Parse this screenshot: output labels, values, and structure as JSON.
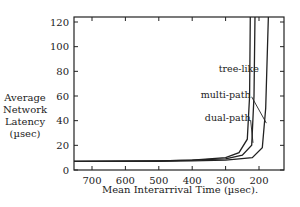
{
  "chart_data": {
    "type": "line",
    "title": "",
    "xlabel": "Mean Interarrival Time (µsec).",
    "ylabel": "Average Network Latency (µsec)",
    "ylabel_lines": [
      "Average",
      "Network",
      "Latency",
      "(µsec)"
    ],
    "x_reversed": true,
    "xlim": [
      754,
      127
    ],
    "ylim": [
      0,
      120
    ],
    "x_ticks": [
      700,
      600,
      500,
      400,
      300,
      200
    ],
    "y_ticks": [
      0,
      20,
      40,
      60,
      80,
      100,
      120
    ],
    "grid": false,
    "legend": "inline annotations",
    "series": [
      {
        "name": "tree-like",
        "x": [
          754,
          500,
          400,
          300,
          260,
          235,
          228,
          226
        ],
        "y": [
          7,
          7.5,
          8,
          10,
          14,
          25,
          60,
          125
        ]
      },
      {
        "name": "multi-path",
        "x": [
          754,
          500,
          400,
          300,
          250,
          222,
          215,
          212
        ],
        "y": [
          7,
          7.5,
          8,
          9,
          12,
          20,
          60,
          125
        ]
      },
      {
        "name": "dual-path",
        "x": [
          754,
          500,
          400,
          300,
          220,
          190,
          180,
          172
        ],
        "y": [
          7,
          7,
          7.5,
          8,
          10,
          18,
          50,
          125
        ]
      }
    ],
    "annotations": [
      {
        "text": "tree-like",
        "x": 200,
        "y": 82
      },
      {
        "text": "multi-path",
        "x": 225,
        "y": 61
      },
      {
        "text": "dual-path",
        "x": 225,
        "y": 42
      }
    ]
  }
}
